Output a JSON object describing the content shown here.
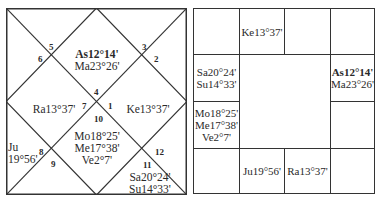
{
  "north_chart": {
    "houses": [
      {
        "num": "1",
        "planets": [
          "Ke13°37'"
        ]
      },
      {
        "num": "2",
        "planets": []
      },
      {
        "num": "3",
        "planets": []
      },
      {
        "num": "4",
        "planets": [
          "As12°14'",
          "Ma23°26'"
        ]
      },
      {
        "num": "5",
        "planets": []
      },
      {
        "num": "6",
        "planets": []
      },
      {
        "num": "7",
        "planets": [
          "Ra13°37'"
        ]
      },
      {
        "num": "8",
        "planets": [
          "Ju",
          "19°56'"
        ]
      },
      {
        "num": "9",
        "planets": []
      },
      {
        "num": "10",
        "planets": [
          "Mo18°25'",
          "Me17°38'",
          "Ve2°7'"
        ]
      },
      {
        "num": "11",
        "planets": [
          "Sa20°24'",
          "Su14°33'"
        ]
      },
      {
        "num": "12",
        "planets": []
      }
    ]
  },
  "south_chart": {
    "cells": [
      {
        "pos": "r0c0",
        "planets": []
      },
      {
        "pos": "r0c1",
        "planets": [
          "Ke13°37'"
        ]
      },
      {
        "pos": "r0c2",
        "planets": []
      },
      {
        "pos": "r0c3",
        "planets": []
      },
      {
        "pos": "r1c0",
        "planets": [
          "Sa20°24'",
          "Su14°33'"
        ]
      },
      {
        "pos": "r1c3",
        "planets": [
          "As12°14'",
          "Ma23°26'"
        ]
      },
      {
        "pos": "r2c0",
        "planets": [
          "Mo18°25'",
          "Me17°38'",
          "Ve2°7'"
        ]
      },
      {
        "pos": "r2c3",
        "planets": []
      },
      {
        "pos": "r3c0",
        "planets": []
      },
      {
        "pos": "r3c1",
        "planets": [
          "Ju19°56'"
        ]
      },
      {
        "pos": "r3c2",
        "planets": [
          "Ra13°37'"
        ]
      },
      {
        "pos": "r3c3",
        "planets": []
      }
    ]
  },
  "colors": {
    "line": "#333333",
    "text": "#2a2a2a"
  }
}
